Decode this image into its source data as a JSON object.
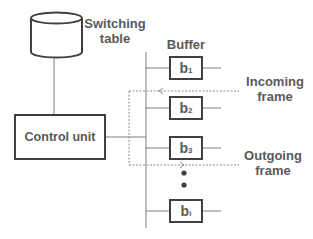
{
  "diagram": {
    "switching_table": {
      "label_line1": "Switching",
      "label_line2": "table"
    },
    "control_unit": {
      "label": "Control unit"
    },
    "buffer_header": "Buffer",
    "buffers": [
      {
        "base": "b",
        "sub": "1"
      },
      {
        "base": "b",
        "sub": "2"
      },
      {
        "base": "b",
        "sub": "3"
      },
      {
        "base": "b",
        "sub": "i"
      }
    ],
    "incoming": {
      "line1": "Incoming",
      "line2": "frame"
    },
    "outgoing": {
      "line1": "Outgoing",
      "line2": "frame"
    },
    "colors": {
      "stroke": "#404040",
      "text": "#595959",
      "thin_line": "#7f7f7f",
      "dotted": "#8c8c8c"
    }
  }
}
